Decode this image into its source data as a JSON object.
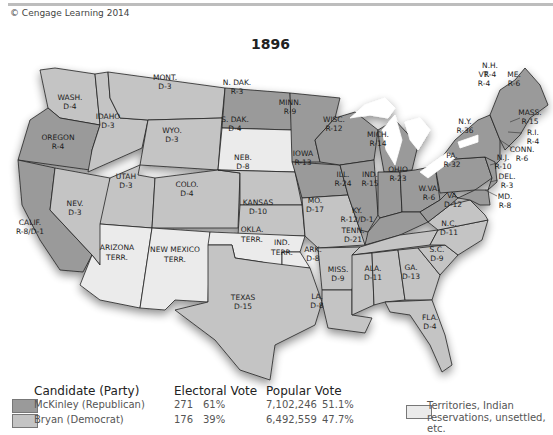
{
  "header": {
    "copyright": "© Cengage Learning 2014",
    "title": "1896"
  },
  "colors": {
    "republican": "#9a9a9a",
    "democrat": "#c4c4c4",
    "territory": "#ebebeb",
    "border": "#222222",
    "water": "#ffffff"
  },
  "states": [
    {
      "name": "WASH.",
      "result": "D-4"
    },
    {
      "name": "OREGON",
      "result": "R-4"
    },
    {
      "name": "CALIF.",
      "result": "R-8/D-1"
    },
    {
      "name": "NEV.",
      "result": "D-3"
    },
    {
      "name": "IDAHO",
      "result": "D-3"
    },
    {
      "name": "MONT.",
      "result": "D-3"
    },
    {
      "name": "WYO.",
      "result": "D-3"
    },
    {
      "name": "UTAH",
      "result": "D-3"
    },
    {
      "name": "COLO.",
      "result": "D-4"
    },
    {
      "name": "N. DAK.",
      "result": "R-3"
    },
    {
      "name": "S. DAK.",
      "result": "D-4"
    },
    {
      "name": "NEB.",
      "result": "D-8"
    },
    {
      "name": "KANSAS",
      "result": "D-10"
    },
    {
      "name": "TEXAS",
      "result": "D-15"
    },
    {
      "name": "MINN.",
      "result": "R-9"
    },
    {
      "name": "IOWA",
      "result": "R-13"
    },
    {
      "name": "MO.",
      "result": "D-17"
    },
    {
      "name": "ARK.",
      "result": "D-8"
    },
    {
      "name": "LA.",
      "result": "D-8"
    },
    {
      "name": "WISC.",
      "result": "R-12"
    },
    {
      "name": "ILL.",
      "result": "R-24"
    },
    {
      "name": "MICH.",
      "result": "R-14"
    },
    {
      "name": "IND.",
      "result": "R-15"
    },
    {
      "name": "OHIO",
      "result": "R-23"
    },
    {
      "name": "KY.",
      "result": "R-12/D-1"
    },
    {
      "name": "TENN.",
      "result": "D-21"
    },
    {
      "name": "MISS.",
      "result": "D-9"
    },
    {
      "name": "ALA.",
      "result": "D-11"
    },
    {
      "name": "GA.",
      "result": "D-13"
    },
    {
      "name": "FLA.",
      "result": "D-4"
    },
    {
      "name": "S.C.",
      "result": "D-9"
    },
    {
      "name": "N.C.",
      "result": "D-11"
    },
    {
      "name": "VA.",
      "result": "D-12"
    },
    {
      "name": "W.VA.",
      "result": "R-6"
    },
    {
      "name": "PA.",
      "result": "R-32"
    },
    {
      "name": "N.Y.",
      "result": "R-36"
    },
    {
      "name": "VT.",
      "result": "R-4"
    },
    {
      "name": "N.H.",
      "result": "R-4"
    },
    {
      "name": "ME.",
      "result": "R-6"
    },
    {
      "name": "MASS.",
      "result": "R-15"
    },
    {
      "name": "R.I.",
      "result": "R-4"
    },
    {
      "name": "CONN.",
      "result": "R-6"
    },
    {
      "name": "N.J.",
      "result": "R-10"
    },
    {
      "name": "DEL.",
      "result": "R-3"
    },
    {
      "name": "MD.",
      "result": "R-8"
    }
  ],
  "territories": [
    {
      "name": "ARIZONA",
      "sub": "TERR."
    },
    {
      "name": "NEW MEXICO",
      "sub": "TERR."
    },
    {
      "name": "OKLA.",
      "sub": "TERR."
    },
    {
      "name": "IND.",
      "sub": "TERR."
    }
  ],
  "legend": {
    "candidate_header": "Candidate (Party)",
    "electoral_header": "Electoral Vote",
    "popular_header": "Popular Vote",
    "rows": [
      {
        "candidate": "McKinley (Republican)",
        "ev": "271",
        "ev_pct": "61%",
        "pv": "7,102,246",
        "pv_pct": "51.1%"
      },
      {
        "candidate": "Bryan (Democrat)",
        "ev": "176",
        "ev_pct": "39%",
        "pv": "6,492,559",
        "pv_pct": "47.7%"
      }
    ],
    "territory_note_line1": "Territories, Indian",
    "territory_note_line2": "reservations, unsettled, etc."
  }
}
